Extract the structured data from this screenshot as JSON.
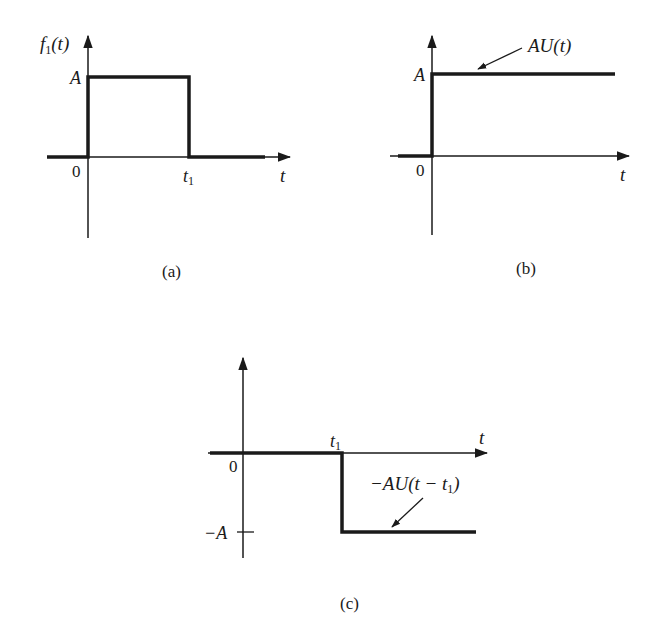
{
  "figure": {
    "panels": [
      {
        "id": "a",
        "caption": "(a)",
        "y_axis_label": "f",
        "y_axis_label_sub": "1",
        "y_axis_label_arg": "(t)",
        "level_label": "A",
        "origin_label": "0",
        "t1_label": "t",
        "t1_sub": "1",
        "x_axis_label": "t",
        "description": "Rectangular pulse of height A from t=0 to t=t1"
      },
      {
        "id": "b",
        "caption": "(b)",
        "level_label": "A",
        "origin_label": "0",
        "x_axis_label": "t",
        "curve_label": "AU(t)",
        "description": "Step function of height A starting at t=0"
      },
      {
        "id": "c",
        "caption": "(c)",
        "level_label": "−A",
        "origin_label": "0",
        "t1_label": "t",
        "t1_sub": "1",
        "x_axis_label": "t",
        "curve_label": "−AU(t − t",
        "curve_label_sub": "1",
        "curve_label_close": ")",
        "description": "Negative step of height −A starting at t=t1"
      }
    ],
    "colors": {
      "ink": "#1a1a1a",
      "background": "#ffffff"
    }
  }
}
